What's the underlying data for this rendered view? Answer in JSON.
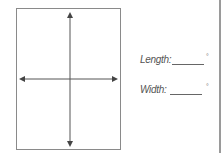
{
  "diagram": {
    "type": "rectangle with crossed double-headed arrows",
    "arrows": [
      "vertical-double-arrow",
      "horizontal-double-arrow"
    ]
  },
  "fields": [
    {
      "label": "Length:",
      "value": "",
      "unit": "°"
    },
    {
      "label": "Width:",
      "value": "",
      "unit": "°"
    }
  ],
  "colors": {
    "line": "#555555",
    "border": "#8a8a8a",
    "text": "#555555"
  }
}
